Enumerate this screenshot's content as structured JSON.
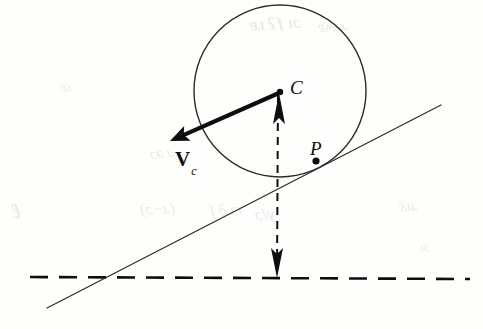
{
  "figure": {
    "background_color": "#fefefd",
    "ink_color": "#0e0e0e",
    "thin_ink_color": "#2a2a2a",
    "ghost_color": "#cfcdc9",
    "width": 483,
    "height": 329
  },
  "labels": {
    "center_label": "C",
    "contact_label": "P",
    "velocity_label": "V",
    "velocity_subscript": "c"
  },
  "geometry": {
    "circle": {
      "name": "rolling-circle",
      "center_x": 280,
      "center_y": 91,
      "radius": 86,
      "stroke_width": 1.4
    },
    "center_point": {
      "name": "center-point-C",
      "x": 280,
      "y": 92,
      "radius": 3.2
    },
    "contact_point": {
      "name": "contact-point-P",
      "x": 316,
      "y": 161,
      "radius": 3.6
    },
    "incline_line": {
      "name": "inclined-surface-line",
      "x1": 47,
      "y1": 308,
      "x2": 441,
      "y2": 105,
      "stroke_width": 1.2
    },
    "ground_dashed_line": {
      "name": "horizontal-reference-line",
      "x1": 30,
      "y1": 277,
      "x2": 470,
      "y2": 279,
      "stroke_width": 2.6,
      "dash": "18 11"
    },
    "vertical_dashed_line": {
      "name": "vertical-height-line",
      "x1": 278,
      "y1": 95,
      "x2": 277,
      "y2": 276,
      "stroke_width": 2.0,
      "dash": "8 6"
    },
    "up_arrow": {
      "name": "up-arrow-head",
      "tip_x": 279,
      "tip_y": 93,
      "base_y": 124,
      "half_width": 6
    },
    "down_arrow": {
      "name": "down-arrow-head",
      "tip_x": 277,
      "tip_y": 278,
      "base_y": 248,
      "half_width": 6
    },
    "velocity_vector": {
      "name": "velocity-vector-arrow",
      "tail_x": 279,
      "tail_y": 93,
      "tip_x": 170,
      "tip_y": 141,
      "stroke_width": 4.2,
      "head_length": 19,
      "head_half_width": 8
    }
  },
  "ghost_marks": [
    {
      "text": "ɔı ƒʔ ʟɐ",
      "x": 250,
      "y": 14,
      "size": 17,
      "rotate": -3,
      "opacity": 0.5
    },
    {
      "text": "ɹǝʍɐ",
      "x": 318,
      "y": 18,
      "size": 15,
      "rotate": -4,
      "opacity": 0.42
    },
    {
      "text": "ɹ ǝɔ",
      "x": 150,
      "y": 145,
      "size": 15,
      "rotate": -7,
      "opacity": 0.4
    },
    {
      "text": "ℓ",
      "x": 12,
      "y": 198,
      "size": 22,
      "rotate": -6,
      "opacity": 0.45
    },
    {
      "text": "(ɹ−ɔ)",
      "x": 140,
      "y": 200,
      "size": 16,
      "rotate": -3,
      "opacity": 0.4
    },
    {
      "text": "ıɔ ∂ ʃ",
      "x": 210,
      "y": 201,
      "size": 16,
      "rotate": -3,
      "opacity": 0.4
    },
    {
      "text": "y/ɔ",
      "x": 255,
      "y": 205,
      "size": 17,
      "rotate": -3,
      "opacity": 0.45
    },
    {
      "text": "ɹıʎ",
      "x": 400,
      "y": 198,
      "size": 15,
      "rotate": -5,
      "opacity": 0.38
    },
    {
      "text": "ʎɐ",
      "x": 60,
      "y": 80,
      "size": 14,
      "rotate": -5,
      "opacity": 0.3
    },
    {
      "text": "ɔı",
      "x": 420,
      "y": 240,
      "size": 14,
      "rotate": -4,
      "opacity": 0.3
    }
  ]
}
